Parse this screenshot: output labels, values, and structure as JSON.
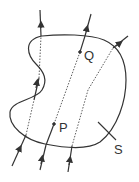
{
  "diagram": {
    "labels": {
      "P": "P",
      "Q": "Q",
      "S": "S"
    },
    "colors": {
      "stroke": "#333333",
      "background": "#ffffff"
    },
    "field_lines": [
      {
        "id": "line-left",
        "description": "enters and exits surface multiple times"
      },
      {
        "id": "line-middle",
        "description": "passes through P and Q"
      },
      {
        "id": "line-right",
        "description": "crosses surface twice"
      }
    ]
  }
}
